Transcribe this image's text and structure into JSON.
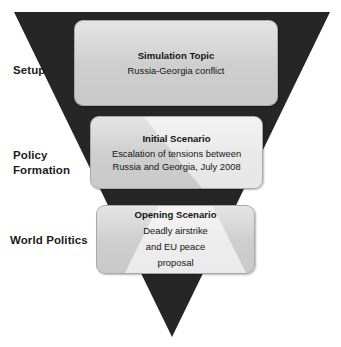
{
  "diagram": {
    "type": "inverted-triangle-funnel",
    "shape_color": "#262626",
    "box_fill_color": "#d0d0d0",
    "text_color": "#141414",
    "stages": [
      {
        "label": "Setup"
      },
      {
        "label": "Policy\nFormation"
      },
      {
        "label": "World Politics"
      }
    ],
    "boxes": [
      {
        "title": "Simulation Topic",
        "body": "Russia-Georgia conflict"
      },
      {
        "title": "Initial Scenario",
        "body": "Escalation of tensions between Russia and Georgia, July 2008"
      },
      {
        "title": "Opening Scenario",
        "body": "Deadly airstrike\nand EU peace\nproposal"
      }
    ]
  }
}
